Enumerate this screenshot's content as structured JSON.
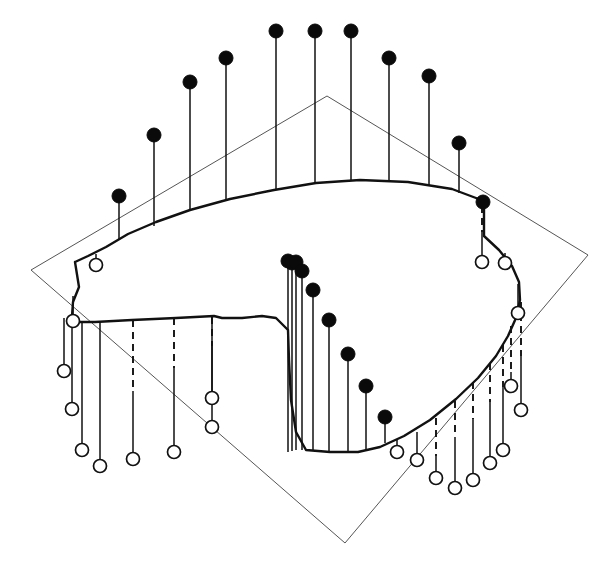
{
  "figure": {
    "title": "",
    "background_color": "#ffffff",
    "width": 612,
    "height": 572
  },
  "chart_data": {
    "type": "scatter",
    "subtype": "3d-stem-plot",
    "title": "",
    "subtitle": "",
    "xlabel": "",
    "ylabel": "",
    "zlabel": "",
    "grid": false,
    "legend": null,
    "axis_ticks": [],
    "annotations": [],
    "reference_plane": {
      "label": "reference-plane",
      "stroke": "#555555",
      "corners": [
        [
          31,
          270
        ],
        [
          327,
          96
        ],
        [
          588,
          255
        ],
        [
          345,
          543
        ]
      ]
    },
    "ridge_curve": {
      "label": "surface-ridge",
      "stroke": "#111111",
      "closed": true,
      "points": [
        [
          75,
          262
        ],
        [
          79,
          287
        ],
        [
          73,
          302
        ],
        [
          72,
          316
        ],
        [
          79,
          322
        ],
        [
          95,
          322
        ],
        [
          132,
          320
        ],
        [
          176,
          318
        ],
        [
          214,
          316
        ],
        [
          214,
          316
        ],
        [
          222,
          318
        ],
        [
          242,
          318
        ],
        [
          262,
          316
        ],
        [
          276,
          318
        ],
        [
          288,
          330
        ],
        [
          289,
          360
        ],
        [
          291,
          400
        ],
        [
          296,
          432
        ],
        [
          306,
          450
        ],
        [
          330,
          452
        ],
        [
          358,
          452
        ],
        [
          380,
          447
        ],
        [
          404,
          436
        ],
        [
          430,
          420
        ],
        [
          456,
          399
        ],
        [
          478,
          378
        ],
        [
          496,
          356
        ],
        [
          508,
          336
        ],
        [
          516,
          318
        ],
        [
          520,
          300
        ],
        [
          519,
          282
        ],
        [
          512,
          266
        ],
        [
          499,
          250
        ],
        [
          484,
          236
        ],
        [
          484,
          201
        ],
        [
          452,
          189
        ],
        [
          408,
          182
        ],
        [
          360,
          180
        ],
        [
          316,
          183
        ],
        [
          274,
          190
        ],
        [
          230,
          199
        ],
        [
          190,
          210
        ],
        [
          156,
          222
        ],
        [
          128,
          234
        ],
        [
          106,
          247
        ],
        [
          88,
          256
        ],
        [
          75,
          262
        ]
      ]
    },
    "markers_above_plane": {
      "style": "filled-black-circle",
      "color": "#0a0a0a",
      "radius": 7,
      "points": [
        {
          "x": 119,
          "y": 196,
          "base_x": 119,
          "base_y": 240
        },
        {
          "x": 154,
          "y": 135,
          "base_x": 154,
          "base_y": 226
        },
        {
          "x": 190,
          "y": 82,
          "base_x": 190,
          "base_y": 211
        },
        {
          "x": 226,
          "y": 58,
          "base_x": 226,
          "base_y": 200
        },
        {
          "x": 276,
          "y": 31,
          "base_x": 276,
          "base_y": 190
        },
        {
          "x": 315,
          "y": 31,
          "base_x": 315,
          "base_y": 184
        },
        {
          "x": 351,
          "y": 31,
          "base_x": 351,
          "base_y": 180
        },
        {
          "x": 389,
          "y": 58,
          "base_x": 389,
          "base_y": 181
        },
        {
          "x": 429,
          "y": 76,
          "base_x": 429,
          "base_y": 186
        },
        {
          "x": 459,
          "y": 143,
          "base_x": 459,
          "base_y": 193
        },
        {
          "x": 483,
          "y": 202,
          "base_x": 483,
          "base_y": 203
        },
        {
          "x": 288,
          "y": 261,
          "base_x": 288,
          "base_y": 452
        },
        {
          "x": 292,
          "y": 263,
          "base_x": 292,
          "base_y": 451
        },
        {
          "x": 296,
          "y": 262,
          "base_x": 296,
          "base_y": 450
        },
        {
          "x": 302,
          "y": 271,
          "base_x": 302,
          "base_y": 450
        },
        {
          "x": 313,
          "y": 290,
          "base_x": 313,
          "base_y": 451
        },
        {
          "x": 329,
          "y": 320,
          "base_x": 329,
          "base_y": 452
        },
        {
          "x": 348,
          "y": 354,
          "base_x": 348,
          "base_y": 452
        },
        {
          "x": 366,
          "y": 386,
          "base_x": 366,
          "base_y": 449
        },
        {
          "x": 385,
          "y": 417,
          "base_x": 385,
          "base_y": 443
        }
      ]
    },
    "markers_below_plane": {
      "style": "open-white-circle",
      "color": "#ffffff",
      "stroke": "#111111",
      "radius": 6.5,
      "points": [
        {
          "x": 96,
          "y": 265,
          "base_x": 96,
          "base_y": 254,
          "hidden_from": null
        },
        {
          "x": 73,
          "y": 321,
          "base_x": 73,
          "base_y": 296,
          "hidden_from": null
        },
        {
          "x": 64,
          "y": 371,
          "base_x": 64,
          "base_y": 318,
          "hidden_from": null
        },
        {
          "x": 72,
          "y": 409,
          "base_x": 72,
          "base_y": 320,
          "hidden_from": null
        },
        {
          "x": 82,
          "y": 450,
          "base_x": 82,
          "base_y": 321,
          "hidden_from": null
        },
        {
          "x": 100,
          "y": 466,
          "base_x": 100,
          "base_y": 322,
          "hidden_from": null
        },
        {
          "x": 133,
          "y": 459,
          "base_x": 133,
          "base_y": 320,
          "hidden_from": 391
        },
        {
          "x": 174,
          "y": 452,
          "base_x": 174,
          "base_y": 318,
          "hidden_from": 368
        },
        {
          "x": 212,
          "y": 427,
          "base_x": 212,
          "base_y": 317,
          "hidden_from": 346
        },
        {
          "x": 212,
          "y": 398,
          "base_x": 212,
          "base_y": 317,
          "hidden_from": 317
        },
        {
          "x": 397,
          "y": 452,
          "base_x": 397,
          "base_y": 440,
          "hidden_from": null
        },
        {
          "x": 417,
          "y": 460,
          "base_x": 417,
          "base_y": 432,
          "hidden_from": null
        },
        {
          "x": 436,
          "y": 478,
          "base_x": 436,
          "base_y": 418,
          "hidden_from": 456
        },
        {
          "x": 455,
          "y": 488,
          "base_x": 455,
          "base_y": 401,
          "hidden_from": 437
        },
        {
          "x": 473,
          "y": 480,
          "base_x": 473,
          "base_y": 382,
          "hidden_from": 419
        },
        {
          "x": 490,
          "y": 463,
          "base_x": 490,
          "base_y": 363,
          "hidden_from": 402
        },
        {
          "x": 503,
          "y": 450,
          "base_x": 503,
          "base_y": 345,
          "hidden_from": 387
        },
        {
          "x": 511,
          "y": 386,
          "base_x": 511,
          "base_y": 326,
          "hidden_from": 372
        },
        {
          "x": 521,
          "y": 410,
          "base_x": 521,
          "base_y": 302,
          "hidden_from": 356
        },
        {
          "x": 518,
          "y": 313,
          "base_x": 518,
          "base_y": 284,
          "hidden_from": null
        },
        {
          "x": 505,
          "y": 263,
          "base_x": 505,
          "base_y": 253,
          "hidden_from": null
        },
        {
          "x": 482,
          "y": 262,
          "base_x": 482,
          "base_y": 206,
          "hidden_from": 232
        }
      ]
    }
  }
}
